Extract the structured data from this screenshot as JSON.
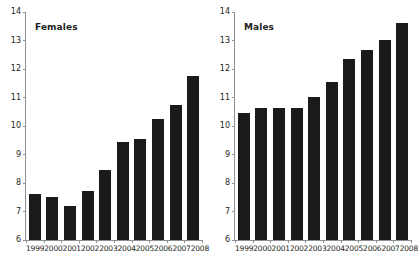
{
  "chart_data": [
    {
      "type": "bar",
      "title": "Females",
      "xlabel": "",
      "ylabel": "",
      "categories": [
        "1999",
        "2000",
        "2001",
        "2002",
        "2003",
        "2004",
        "2005",
        "2006",
        "2007",
        "2008"
      ],
      "values": [
        7.6,
        7.5,
        7.2,
        7.72,
        8.45,
        9.45,
        9.55,
        10.25,
        10.75,
        11.75
      ],
      "ylim": [
        6,
        14
      ],
      "yticks": [
        6,
        7,
        8,
        9,
        10,
        11,
        12,
        13,
        14
      ],
      "grid": false,
      "legend": "none",
      "bar_color": "#1a1a1a"
    },
    {
      "type": "bar",
      "title": "Males",
      "xlabel": "",
      "ylabel": "",
      "categories": [
        "1999",
        "2000",
        "2001",
        "2002",
        "2003",
        "2004",
        "2005",
        "2006",
        "2007",
        "2008"
      ],
      "values": [
        10.45,
        10.63,
        10.63,
        10.63,
        11.03,
        11.53,
        12.35,
        12.65,
        13.03,
        13.62
      ],
      "ylim": [
        6,
        14
      ],
      "yticks": [
        6,
        7,
        8,
        9,
        10,
        11,
        12,
        13,
        14
      ],
      "grid": false,
      "legend": "none",
      "bar_color": "#1a1a1a"
    }
  ],
  "axis": {
    "line_color": "#8d8f91"
  }
}
